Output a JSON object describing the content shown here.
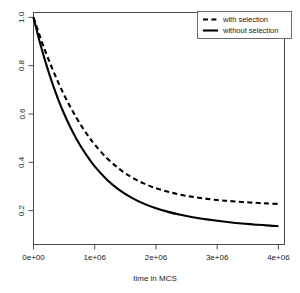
{
  "chart_data": {
    "type": "line",
    "title": "",
    "xlabel": "time in MCS",
    "ylabel": "",
    "xlim": [
      0,
      4100000
    ],
    "ylim": [
      0.06,
      1.02
    ],
    "grid": false,
    "legend_position": "top-right",
    "x_ticks": [
      {
        "value": 0,
        "label": "0e+00"
      },
      {
        "value": 1000000,
        "label": "1e+06"
      },
      {
        "value": 2000000,
        "label": "2e+06"
      },
      {
        "value": 3000000,
        "label": "3e+06"
      },
      {
        "value": 4000000,
        "label": "4e+06"
      }
    ],
    "y_ticks": [
      {
        "value": 1.0,
        "label": "1.0"
      },
      {
        "value": 0.8,
        "label": "0.8"
      },
      {
        "value": 0.6,
        "label": "0.6"
      },
      {
        "value": 0.4,
        "label": "0.4"
      },
      {
        "value": 0.2,
        "label": "0.2"
      }
    ],
    "x": [
      0,
      100000,
      200000,
      300000,
      400000,
      500000,
      600000,
      700000,
      800000,
      900000,
      1000000,
      1200000,
      1400000,
      1600000,
      1800000,
      2000000,
      2200000,
      2400000,
      2600000,
      2800000,
      3000000,
      3200000,
      3400000,
      3600000,
      3800000,
      4000000
    ],
    "series": [
      {
        "name": "with selection",
        "style": "dashed",
        "color": "#000000",
        "values": [
          1.0,
          0.925,
          0.855,
          0.792,
          0.733,
          0.679,
          0.63,
          0.585,
          0.544,
          0.507,
          0.473,
          0.417,
          0.373,
          0.339,
          0.313,
          0.293,
          0.278,
          0.266,
          0.257,
          0.25,
          0.244,
          0.24,
          0.236,
          0.233,
          0.23,
          0.228
        ]
      },
      {
        "name": "without selection",
        "style": "solid",
        "color": "#000000",
        "values": [
          1.0,
          0.9,
          0.812,
          0.733,
          0.663,
          0.601,
          0.546,
          0.498,
          0.455,
          0.417,
          0.383,
          0.328,
          0.286,
          0.254,
          0.229,
          0.21,
          0.195,
          0.183,
          0.173,
          0.165,
          0.158,
          0.152,
          0.147,
          0.143,
          0.139,
          0.136
        ]
      }
    ]
  },
  "legend": {
    "entries": [
      {
        "label": "with selection"
      },
      {
        "label": "without selection"
      }
    ]
  }
}
